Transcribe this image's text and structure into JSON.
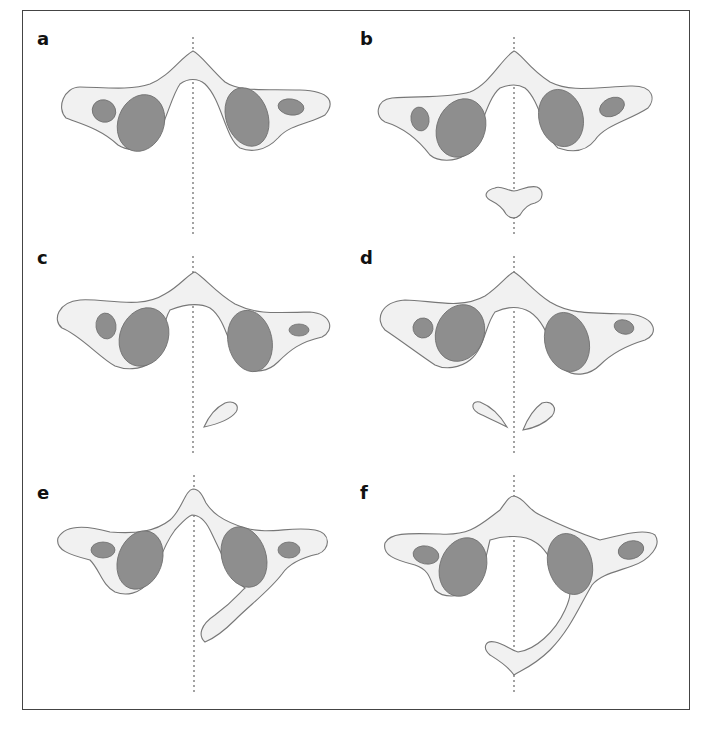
{
  "figure": {
    "panels": [
      {
        "id": "a",
        "label": "a",
        "description": "Normal atlas with symmetric lateral masses"
      },
      {
        "id": "b",
        "label": "b",
        "description": "Atlas with separate anterior midline ossicle"
      },
      {
        "id": "c",
        "label": "c",
        "description": "Atlas with unilateral posterior arch fragment"
      },
      {
        "id": "d",
        "label": "d",
        "description": "Atlas with bilateral posterior arch fragments"
      },
      {
        "id": "e",
        "label": "e",
        "description": "Atlas with unilateral hemi-arch posterior"
      },
      {
        "id": "f",
        "label": "f",
        "description": "Atlas with near-complete posterior arch from one side"
      }
    ],
    "colors": {
      "bone_fill": "#f1f1f1",
      "bone_stroke": "#777777",
      "facet_fill": "#8e8e8e",
      "midline_axis": "#666666",
      "frame": "#444444"
    }
  }
}
